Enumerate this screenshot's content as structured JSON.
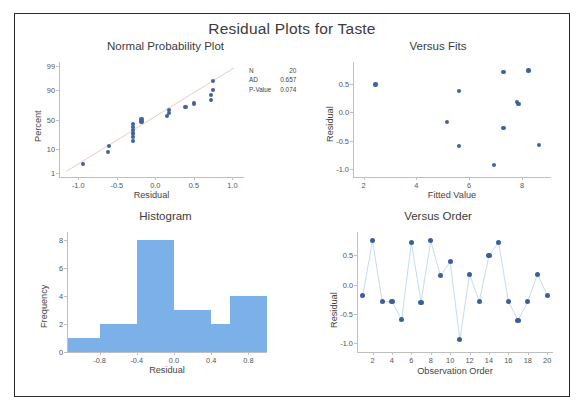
{
  "title": "Residual Plots for Taste",
  "panels": {
    "normal_probability": {
      "title": "Normal Probability Plot",
      "xlabel": "Residual",
      "ylabel": "Percent",
      "xticks": [
        "-1.0",
        "-0.5",
        "0.0",
        "0.5",
        "1.0"
      ],
      "yticks": [
        "1",
        "10",
        "50",
        "90",
        "99"
      ],
      "stats": [
        {
          "label": "N",
          "value": "20"
        },
        {
          "label": "AD",
          "value": "0.657"
        },
        {
          "label": "P-Value",
          "value": "0.074"
        }
      ]
    },
    "versus_fits": {
      "title": "Versus Fits",
      "xlabel": "Fitted Value",
      "ylabel": "Residual",
      "xticks": [
        "2",
        "4",
        "6",
        "8"
      ],
      "yticks": [
        "-1.0",
        "-0.5",
        "0.0",
        "0.5"
      ]
    },
    "histogram": {
      "title": "Histogram",
      "xlabel": "Residual",
      "ylabel": "Frequency",
      "xticks": [
        "-0.8",
        "-0.4",
        "0.0",
        "0.4",
        "0.8"
      ],
      "yticks": [
        "0",
        "2",
        "4",
        "6",
        "8"
      ]
    },
    "versus_order": {
      "title": "Versus Order",
      "xlabel": "Observation Order",
      "ylabel": "Residual",
      "xticks": [
        "2",
        "4",
        "6",
        "8",
        "10",
        "12",
        "14",
        "16",
        "18",
        "20"
      ],
      "yticks": [
        "-1.0",
        "-0.5",
        "0.0",
        "0.5"
      ]
    }
  },
  "colors": {
    "marker": "#41629e",
    "bar": "#7cb0e8",
    "reference_line": "#e8cdbf",
    "series_line": "#c5dcf2",
    "frame": "#2b2b2b",
    "axis": "#bfbfbf"
  },
  "chart_data": [
    {
      "type": "scatter",
      "title": "Normal Probability Plot",
      "xlabel": "Residual",
      "ylabel": "Percent",
      "xlim": [
        -1.25,
        1.15
      ],
      "ylim": [
        1,
        99
      ],
      "yscale": "probability",
      "grid": false,
      "annotations": [
        "N 20",
        "AD 0.657",
        "P-Value 0.074"
      ],
      "reference_line": true,
      "x": [
        -0.94,
        -0.61,
        -0.6,
        -0.29,
        -0.29,
        -0.29,
        -0.29,
        -0.29,
        -0.29,
        -0.18,
        -0.18,
        0.15,
        0.18,
        0.18,
        0.39,
        0.5,
        0.72,
        0.72,
        0.75,
        0.75
      ],
      "y": [
        2.7,
        7.6,
        12.4,
        17.3,
        22.2,
        27.0,
        31.9,
        36.8,
        41.7,
        46.5,
        51.4,
        56.3,
        61.2,
        66.0,
        70.9,
        75.8,
        80.6,
        85.5,
        90.4,
        95.3
      ]
    },
    {
      "type": "scatter",
      "title": "Versus Fits",
      "xlabel": "Fitted Value",
      "ylabel": "Residual",
      "xlim": [
        1.6,
        9.1
      ],
      "ylim": [
        -1.15,
        0.9
      ],
      "grid": false,
      "x": [
        2.45,
        5.15,
        5.6,
        5.6,
        6.95,
        7.3,
        7.3,
        7.82,
        7.85,
        7.9,
        8.25,
        8.65
      ],
      "y": [
        0.5,
        -0.17,
        0.39,
        -0.6,
        -0.94,
        0.72,
        -0.28,
        0.18,
        0.15,
        0.15,
        0.75,
        -0.58
      ]
    },
    {
      "type": "bar",
      "title": "Histogram",
      "xlabel": "Residual",
      "ylabel": "Frequency",
      "categories": [
        "-1.0",
        "-0.6",
        "-0.2",
        "0.2",
        "0.4",
        "0.8"
      ],
      "bin_centers": [
        -0.95,
        -0.6,
        -0.2,
        0.2,
        0.42,
        0.8
      ],
      "values": [
        1,
        2,
        8,
        3,
        2,
        4
      ],
      "ylim": [
        0,
        8.6
      ],
      "xlim": [
        -1.15,
        1.0
      ],
      "grid": false
    },
    {
      "type": "line",
      "title": "Versus Order",
      "xlabel": "Observation Order",
      "ylabel": "Residual",
      "xlim": [
        0.4,
        20.6
      ],
      "ylim": [
        -1.15,
        0.9
      ],
      "grid": false,
      "markers": true,
      "x": [
        1,
        2,
        3,
        4,
        5,
        6,
        7,
        8,
        9,
        10,
        11,
        12,
        13,
        14,
        15,
        16,
        17,
        18,
        19,
        20
      ],
      "y": [
        -0.18,
        0.75,
        -0.29,
        -0.29,
        -0.6,
        0.72,
        -0.3,
        0.75,
        0.15,
        0.39,
        -0.94,
        0.18,
        -0.29,
        0.5,
        0.72,
        -0.29,
        -0.61,
        -0.29,
        0.18,
        -0.18
      ]
    }
  ]
}
